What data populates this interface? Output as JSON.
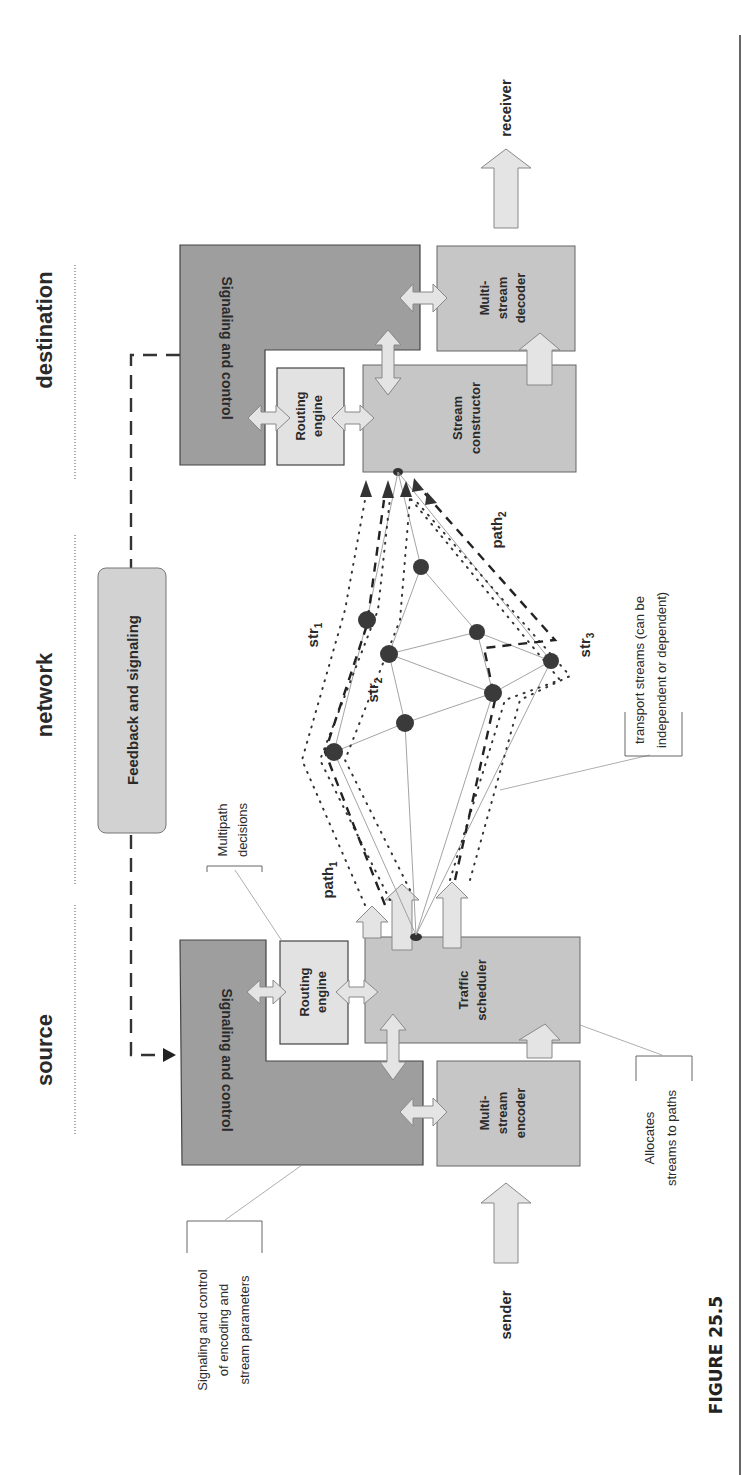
{
  "figure": {
    "label": "FIGURE 25.5",
    "orientation": "rotated 90° counterclockwise"
  },
  "sections": {
    "source": "source",
    "network": "network",
    "destination": "destination"
  },
  "source": {
    "signaling_control": "Signaling and control",
    "routing_engine_line1": "Routing",
    "routing_engine_line2": "engine",
    "traffic_scheduler_line1": "Traffic",
    "traffic_scheduler_line2": "scheduler",
    "encoder_line1": "Multi-",
    "encoder_line2": "stream",
    "encoder_line3": "encoder",
    "input_label": "sender"
  },
  "destination": {
    "signaling_control": "Signaling and control",
    "routing_engine_line1": "Routing",
    "routing_engine_line2": "engine",
    "stream_constructor_line1": "Stream",
    "stream_constructor_line2": "constructor",
    "decoder_line1": "Multi-",
    "decoder_line2": "stream",
    "decoder_line3": "decoder",
    "output_label": "receiver"
  },
  "network": {
    "feedback_box": "Feedback and signaling",
    "paths": [
      {
        "base": "path",
        "sub": "1"
      },
      {
        "base": "path",
        "sub": "2"
      }
    ],
    "streams": [
      {
        "base": "str",
        "sub": "1"
      },
      {
        "base": "str",
        "sub": "2"
      },
      {
        "base": "str",
        "sub": "3"
      }
    ],
    "node_count": 9
  },
  "callouts": {
    "signaling_params_line1": "Signaling and control",
    "signaling_params_line2": "of encoding and",
    "signaling_params_line3": "stream parameters",
    "multipath_line1": "Multipath",
    "multipath_line2": "decisions",
    "allocates_line1": "Allocates",
    "allocates_line2": "streams to paths",
    "transport_line1": "transport streams (can be",
    "transport_line2": "independent or dependent)"
  },
  "colors": {
    "dark_block": "#9a9a9a",
    "mid_block": "#c4c4c4",
    "light_block": "#dedede",
    "arrow_fill": "#e2e2e2",
    "node": "#3a3a3a",
    "stroke": "#444444"
  }
}
